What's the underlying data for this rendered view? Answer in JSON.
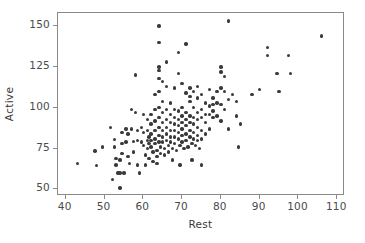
{
  "chart_data": {
    "type": "scatter",
    "title": "",
    "subtitle": "",
    "xlabel": "Rest",
    "ylabel": "Active",
    "xlim": [
      38,
      112
    ],
    "ylim": [
      46,
      158
    ],
    "xticks": [
      40,
      50,
      60,
      70,
      80,
      90,
      100,
      110
    ],
    "yticks": [
      50,
      75,
      100,
      125,
      150
    ],
    "xtick_labels": [
      "40",
      "50",
      "60",
      "70",
      "80",
      "90",
      "100",
      "110"
    ],
    "ytick_labels": [
      "50",
      "75",
      "100",
      "125",
      "150"
    ],
    "grid": false,
    "legend": null,
    "legend_position": "none",
    "annotations": [],
    "marker": {
      "shape": "circle",
      "color": "#3a3a3a",
      "size_px": 3.4,
      "filled": true
    },
    "frame": {
      "border": true,
      "border_color": "#8a8a8a",
      "background": "#ffffff"
    },
    "n_points": 198,
    "correlation_description": "positive",
    "series": [
      {
        "name": "observations",
        "points": [
          [
            43,
            66
          ],
          [
            47.5,
            73.5
          ],
          [
            48,
            64.5
          ],
          [
            49.5,
            76
          ],
          [
            51.5,
            88
          ],
          [
            52,
            56
          ],
          [
            52.5,
            76
          ],
          [
            52.5,
            80.5
          ],
          [
            53,
            69
          ],
          [
            53,
            65
          ],
          [
            53.5,
            60
          ],
          [
            54,
            51
          ],
          [
            54,
            60
          ],
          [
            54,
            68
          ],
          [
            54.5,
            85
          ],
          [
            54.5,
            78
          ],
          [
            54.5,
            72
          ],
          [
            55,
            60
          ],
          [
            55.5,
            87
          ],
          [
            55.5,
            79
          ],
          [
            56,
            84
          ],
          [
            56,
            70
          ],
          [
            56.5,
            66
          ],
          [
            57,
            99
          ],
          [
            57,
            87
          ],
          [
            57.5,
            79.5
          ],
          [
            57.5,
            73
          ],
          [
            58,
            120
          ],
          [
            58,
            97
          ],
          [
            58.5,
            86
          ],
          [
            58.5,
            80
          ],
          [
            58.5,
            65
          ],
          [
            59,
            60
          ],
          [
            59.5,
            88
          ],
          [
            59.5,
            79
          ],
          [
            60,
            96
          ],
          [
            60,
            85
          ],
          [
            60,
            77
          ],
          [
            60.5,
            71
          ],
          [
            60.5,
            65
          ],
          [
            61,
            93
          ],
          [
            61,
            86
          ],
          [
            61,
            80
          ],
          [
            61,
            75
          ],
          [
            61.5,
            82
          ],
          [
            61.5,
            78
          ],
          [
            61.5,
            69
          ],
          [
            62,
            96
          ],
          [
            62,
            90
          ],
          [
            62,
            84
          ],
          [
            62,
            80
          ],
          [
            62,
            76
          ],
          [
            62.5,
            73
          ],
          [
            62.5,
            67
          ],
          [
            63,
            108
          ],
          [
            63,
            99
          ],
          [
            63,
            92
          ],
          [
            63,
            86
          ],
          [
            63,
            81
          ],
          [
            63,
            78
          ],
          [
            63.5,
            74
          ],
          [
            63.5,
            70
          ],
          [
            63.5,
            66
          ],
          [
            64,
            150
          ],
          [
            64,
            140
          ],
          [
            64,
            125
          ],
          [
            64,
            123
          ],
          [
            64,
            118
          ],
          [
            64,
            110
          ],
          [
            64,
            100
          ],
          [
            64,
            94
          ],
          [
            64,
            88
          ],
          [
            64,
            83
          ],
          [
            64,
            79
          ],
          [
            64.5,
            76
          ],
          [
            64.5,
            72
          ],
          [
            65,
            116
          ],
          [
            65,
            104
          ],
          [
            65,
            97
          ],
          [
            65,
            91
          ],
          [
            65,
            86
          ],
          [
            65,
            82
          ],
          [
            65,
            79
          ],
          [
            65.5,
            75
          ],
          [
            65.5,
            71
          ],
          [
            66,
            128
          ],
          [
            66,
            113
          ],
          [
            66,
            99
          ],
          [
            66,
            93
          ],
          [
            66,
            88
          ],
          [
            66,
            84
          ],
          [
            66,
            80
          ],
          [
            66.5,
            77
          ],
          [
            66.5,
            73
          ],
          [
            67,
            103
          ],
          [
            67,
            96
          ],
          [
            67,
            91
          ],
          [
            67,
            86
          ],
          [
            67,
            82
          ],
          [
            67,
            79
          ],
          [
            67.5,
            75
          ],
          [
            67.5,
            68
          ],
          [
            68,
            112
          ],
          [
            68,
            99
          ],
          [
            68,
            94
          ],
          [
            68,
            90
          ],
          [
            68,
            86
          ],
          [
            68,
            82
          ],
          [
            68,
            78
          ],
          [
            68.5,
            74
          ],
          [
            69,
            134
          ],
          [
            69,
            121
          ],
          [
            69,
            98
          ],
          [
            69,
            93
          ],
          [
            69,
            89
          ],
          [
            69,
            85
          ],
          [
            69,
            81
          ],
          [
            69.5,
            77
          ],
          [
            69.5,
            65
          ],
          [
            70,
            115
          ],
          [
            70,
            100
          ],
          [
            70,
            95
          ],
          [
            70,
            91
          ],
          [
            70,
            87
          ],
          [
            70,
            83
          ],
          [
            70,
            79
          ],
          [
            70.5,
            75
          ],
          [
            71,
            139
          ],
          [
            71,
            109
          ],
          [
            71,
            97
          ],
          [
            71,
            93
          ],
          [
            71,
            89
          ],
          [
            71,
            84
          ],
          [
            71,
            80
          ],
          [
            71.5,
            76
          ],
          [
            72,
            112
          ],
          [
            72,
            107
          ],
          [
            72,
            104
          ],
          [
            72,
            95
          ],
          [
            72,
            91
          ],
          [
            72,
            86
          ],
          [
            72,
            82
          ],
          [
            72.5,
            78
          ],
          [
            72.5,
            68
          ],
          [
            73,
            110
          ],
          [
            73,
            100
          ],
          [
            73,
            94
          ],
          [
            73,
            90
          ],
          [
            73,
            85
          ],
          [
            73,
            81
          ],
          [
            73.5,
            77
          ],
          [
            74,
            113
          ],
          [
            74,
            106
          ],
          [
            74,
            97
          ],
          [
            74,
            93
          ],
          [
            74,
            88
          ],
          [
            74,
            83
          ],
          [
            74,
            80
          ],
          [
            74.5,
            75
          ],
          [
            75,
            108
          ],
          [
            75,
            99
          ],
          [
            75,
            94
          ],
          [
            75,
            86
          ],
          [
            75,
            81
          ],
          [
            75,
            65
          ],
          [
            76,
            103
          ],
          [
            76,
            96
          ],
          [
            76,
            91
          ],
          [
            76,
            84
          ],
          [
            77,
            111
          ],
          [
            77,
            101
          ],
          [
            77,
            96
          ],
          [
            77,
            87
          ],
          [
            78,
            106
          ],
          [
            78,
            102
          ],
          [
            78,
            98
          ],
          [
            78,
            94
          ],
          [
            79,
            110
          ],
          [
            79,
            103
          ],
          [
            79,
            95
          ],
          [
            80,
            125
          ],
          [
            80,
            122
          ],
          [
            80,
            112
          ],
          [
            80,
            102
          ],
          [
            80,
            92
          ],
          [
            81,
            119
          ],
          [
            81,
            110
          ],
          [
            81,
            99
          ],
          [
            82,
            153
          ],
          [
            82,
            105
          ],
          [
            82,
            87
          ],
          [
            83,
            108
          ],
          [
            84,
            104
          ],
          [
            84,
            95
          ],
          [
            84.5,
            76
          ],
          [
            85,
            90
          ],
          [
            88,
            108
          ],
          [
            90,
            111
          ],
          [
            92,
            137
          ],
          [
            92,
            132
          ],
          [
            94.5,
            121
          ],
          [
            95,
            110
          ],
          [
            97.5,
            132
          ],
          [
            98,
            121
          ],
          [
            106,
            144
          ]
        ]
      }
    ]
  },
  "axes": {
    "x_axis_label": "Rest",
    "y_axis_label": "Active"
  }
}
